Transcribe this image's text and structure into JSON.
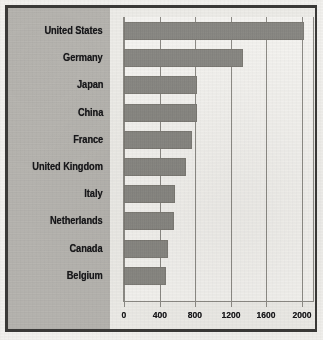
{
  "chart_data": {
    "type": "bar",
    "orientation": "horizontal",
    "title": "",
    "xlabel": "",
    "ylabel": "",
    "categories": [
      "United States",
      "Germany",
      "Japan",
      "China",
      "France",
      "United Kingdom",
      "Italy",
      "Netherlands",
      "Canada",
      "Belgium"
    ],
    "values": [
      2030,
      1340,
      820,
      820,
      770,
      700,
      570,
      560,
      500,
      470
    ],
    "xlim": [
      0,
      2150
    ],
    "xticks": [
      0,
      400,
      800,
      1200,
      1600,
      2000
    ],
    "xtick_labels": [
      "0",
      "400",
      "800",
      "1200",
      "1600",
      "2000"
    ],
    "grid": true,
    "grid_axis": "x",
    "legend": false,
    "bar_color": "#8e8d88",
    "panel_color": "#b9b7b2",
    "plot_background": "#f4f3f0",
    "axis_color": "#8d8b86",
    "frame_color": "#3b3a38",
    "text_color": "#17171a"
  },
  "ghost_text": {
    "a": "",
    "b": "",
    "c": ""
  }
}
